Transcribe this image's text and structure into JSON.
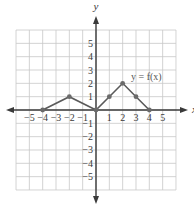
{
  "chart_data": {
    "type": "line",
    "title": "",
    "function_label": "y = f(x)",
    "xlabel": "x",
    "ylabel": "y",
    "xlim": [
      -6,
      6
    ],
    "ylim": [
      -6,
      6
    ],
    "grid": true,
    "x_ticks": [
      -5,
      -4,
      -3,
      -2,
      -1,
      1,
      2,
      3,
      4,
      5
    ],
    "y_ticks": [
      5,
      4,
      3,
      2,
      1,
      -1,
      -2,
      -3,
      -4,
      -5
    ],
    "x_tick_labels": [
      "−5",
      "−4",
      "−3",
      "−2",
      "−1",
      "1",
      "2",
      "3",
      "4",
      "5"
    ],
    "y_tick_labels": [
      "5",
      "4",
      "3",
      "2",
      "1",
      "−1",
      "−2",
      "−3",
      "−4",
      "−5"
    ],
    "series": [
      {
        "name": "y = f(x)",
        "points": [
          [
            -4,
            0
          ],
          [
            -2,
            1
          ],
          [
            0,
            0
          ],
          [
            1,
            1
          ],
          [
            2,
            2
          ],
          [
            3,
            1
          ],
          [
            4,
            0
          ]
        ]
      }
    ]
  },
  "colors": {
    "grid": "#c8c8c8",
    "axis": "#3a3a3a",
    "curve": "#5a5a5a",
    "point": "#6a6a6a"
  }
}
